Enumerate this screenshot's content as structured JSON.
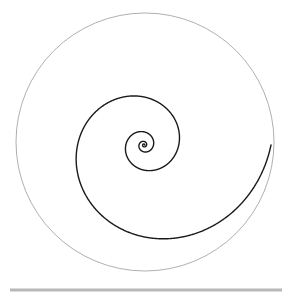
{
  "figure": {
    "title": "Logarithmic spiral inscribed in a bounding circle",
    "width": 289,
    "height": 299,
    "background_color": "#ffffff"
  },
  "chart_data": {
    "type": "line",
    "title": "Logarithmic spiral inscribed in a bounding circle",
    "subtitle": "",
    "xlabel": "",
    "ylabel": "",
    "grid": false,
    "legend": "none",
    "axes_visible": false,
    "tick_labels_x": [],
    "tick_labels_y": [],
    "xlim": [
      -1.1,
      1.1
    ],
    "ylim": [
      -1.1,
      1.1
    ],
    "series": [
      {
        "name": "bounding-circle",
        "kind": "circle",
        "center_px": [
          145,
          142
        ],
        "radius_px": 129,
        "color": "#9a9a9a",
        "line_width": 0.8,
        "polar_equation": "r = 1"
      },
      {
        "name": "logarithmic-spiral",
        "kind": "polar-curve",
        "color": "#1a1a1a",
        "line_width": 1.4,
        "polar_equation": "r = a * exp(b * theta)",
        "growth_b": 0.2063,
        "scale_a_px": 127,
        "pole_px": [
          144,
          145
        ],
        "theta_start_deg": 0,
        "theta_end_deg": -1440,
        "turns": 4,
        "direction": "inward-clockwise",
        "max_radius_px": 127,
        "min_radius_px": 0.6,
        "extent_top_px": 52,
        "extent_bottom_px": 243,
        "extent_right_px": 272,
        "extent_left_px": 103
      },
      {
        "name": "baseline-rule",
        "kind": "horizontal-line",
        "color": "#b8b8b8",
        "line_width": 3,
        "x_start_px": 10,
        "x_end_px": 282,
        "y_px": 290
      }
    ],
    "colors": {
      "curve": "#1a1a1a",
      "circle": "#9a9a9a",
      "rule": "#b8b8b8",
      "background": "#ffffff"
    }
  }
}
